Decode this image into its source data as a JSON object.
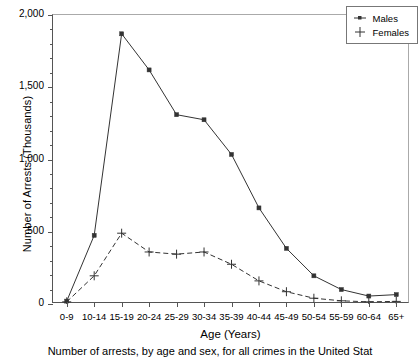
{
  "chart_data": {
    "type": "line",
    "title": "",
    "xlabel": "Age  (Years)",
    "ylabel": "Number of Arrests (Thousands)",
    "categories": [
      "0-9",
      "10-14",
      "15-19",
      "20-24",
      "25-29",
      "30-34",
      "35-39",
      "40-44",
      "45-49",
      "50-54",
      "55-59",
      "60-64",
      "65+"
    ],
    "ylim": [
      0,
      2000
    ],
    "ytick_labels": [
      "0",
      "500",
      "1,000",
      "1,500",
      "2,000"
    ],
    "ytick_values": [
      0,
      500,
      1000,
      1500,
      2000
    ],
    "yminor_step": 100,
    "grid": false,
    "legend_position": "top-right",
    "series": [
      {
        "name": "Males",
        "marker": "square",
        "line_style": "solid",
        "color": "#333333",
        "values": [
          20,
          475,
          1870,
          1620,
          1310,
          1275,
          1035,
          665,
          385,
          195,
          100,
          55,
          65
        ]
      },
      {
        "name": "Females",
        "marker": "plus",
        "line_style": "dashed",
        "color": "#333333",
        "values": [
          15,
          195,
          490,
          360,
          345,
          360,
          275,
          160,
          85,
          40,
          22,
          15,
          18
        ]
      }
    ]
  },
  "legend": {
    "items": [
      {
        "label": "Males",
        "symbol": "dot-line"
      },
      {
        "label": "Females",
        "symbol": "plus"
      }
    ]
  },
  "caption": "Number of arrests, by age and sex, for all crimes in the United Stat"
}
